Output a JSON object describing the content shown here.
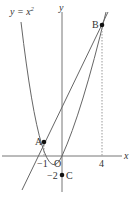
{
  "diagram": {
    "curve_label": "y = x²",
    "curve_label_base": "y = x",
    "curve_label_exp": "2",
    "axes": {
      "x_label": "x",
      "y_label": "y",
      "origin_label": "O"
    },
    "ticks": {
      "x_neg1": "−1",
      "x_4": "4",
      "y_neg2": "−2"
    },
    "points": {
      "A": {
        "label": "A",
        "x": -1,
        "y": 1
      },
      "B": {
        "label": "B",
        "x": 4,
        "y": 16
      },
      "C": {
        "label": "C",
        "x": 0,
        "y": -2
      }
    },
    "colors": {
      "stroke": "#555555",
      "point": "#111111",
      "dashed": "#888888"
    }
  }
}
